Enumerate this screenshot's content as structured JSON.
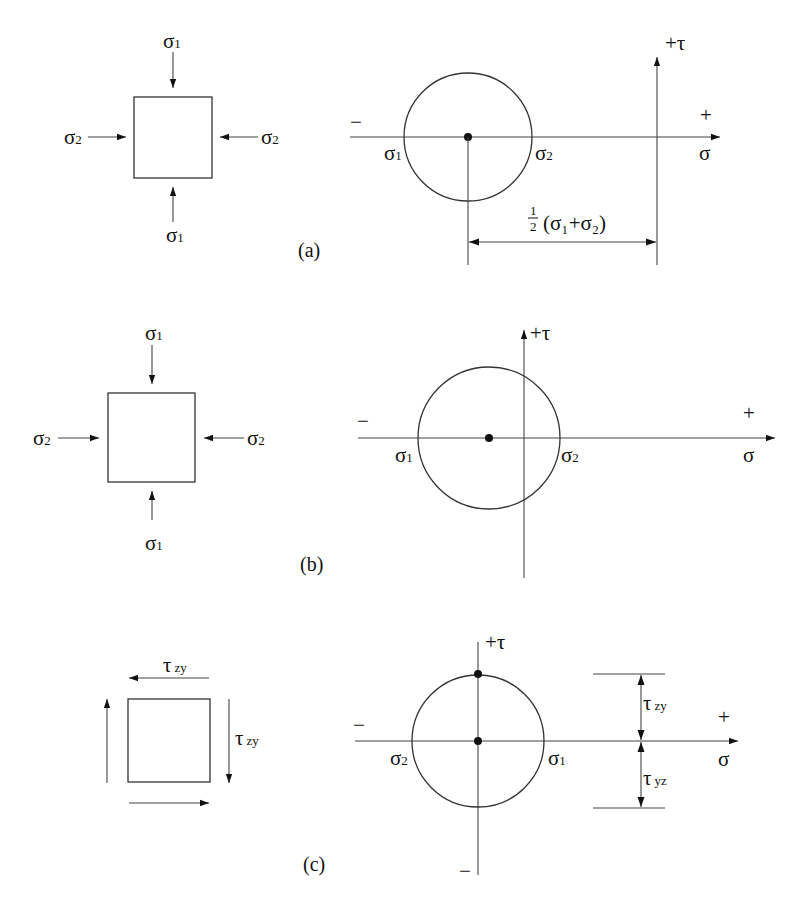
{
  "figure": {
    "panels": [
      {
        "id": "a",
        "caption": "(a)",
        "element": {
          "top_label": "σ",
          "top_sub": "1",
          "bottom_label": "σ",
          "bottom_sub": "1",
          "left_label": "σ",
          "left_sub": "2",
          "right_label": "σ",
          "right_sub": "2"
        },
        "mohr": {
          "tau_axis_label": "+τ",
          "plus_label": "+",
          "minus_label": "−",
          "sigma_axis_label": "σ",
          "left_intercept": "σ",
          "left_intercept_sub": "1",
          "right_intercept": "σ",
          "right_intercept_sub": "2",
          "dimension_frac_num": "1",
          "dimension_frac_den": "2",
          "dimension_expr": "(σ₁+σ₂)"
        }
      },
      {
        "id": "b",
        "caption": "(b)",
        "element": {
          "top_label": "σ",
          "top_sub": "1",
          "bottom_label": "σ",
          "bottom_sub": "1",
          "left_label": "σ",
          "left_sub": "2",
          "right_label": "σ",
          "right_sub": "2"
        },
        "mohr": {
          "tau_axis_label": "+τ",
          "plus_label": "+",
          "minus_label": "−",
          "sigma_axis_label": "σ",
          "left_intercept": "σ",
          "left_intercept_sub": "1",
          "right_intercept": "σ",
          "right_intercept_sub": "2"
        }
      },
      {
        "id": "c",
        "caption": "(c)",
        "element": {
          "top_label": "τ",
          "top_sub": "zy",
          "right_label": "τ",
          "right_sub": "zy"
        },
        "mohr": {
          "tau_axis_label": "+τ",
          "tau_minus_label": "−",
          "plus_label": "+",
          "minus_label": "−",
          "sigma_axis_label": "σ",
          "left_intercept": "σ",
          "left_intercept_sub": "2",
          "right_intercept": "σ",
          "right_intercept_sub": "1",
          "upper_dim": "τ",
          "upper_dim_sub": "zy",
          "lower_dim": "τ",
          "lower_dim_sub": "yz"
        }
      }
    ]
  }
}
